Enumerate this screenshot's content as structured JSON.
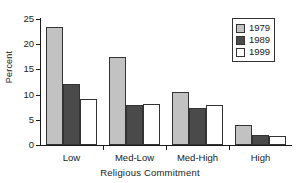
{
  "chart_data": {
    "type": "bar",
    "title": "",
    "subtitle": "",
    "xlabel": "Religious Commitment",
    "ylabel": "Percent",
    "categories": [
      "Low",
      "Med-Low",
      "Med-High",
      "High"
    ],
    "series": [
      {
        "name": "1979",
        "values": [
          23.5,
          17.4,
          10.5,
          3.9
        ],
        "color": "#c2c2c2"
      },
      {
        "name": "1989",
        "values": [
          12.2,
          7.9,
          7.4,
          2.0
        ],
        "color": "#4a4a4a"
      },
      {
        "name": "1999",
        "values": [
          9.1,
          8.1,
          8.0,
          1.8
        ],
        "color": "#ffffff"
      }
    ],
    "ylim": [
      0,
      25
    ],
    "yticks": [
      0,
      5,
      10,
      15,
      20,
      25
    ],
    "ytick_labels": [
      "0",
      "5",
      "10",
      "15",
      "20",
      "25"
    ],
    "grid": false,
    "legend_position": "top-right",
    "legend_entries": [
      "1979",
      "1989",
      "1999"
    ],
    "bar_edge_color": "#333333",
    "axis_color": "#1a1a1a",
    "background": "#ffffff"
  }
}
